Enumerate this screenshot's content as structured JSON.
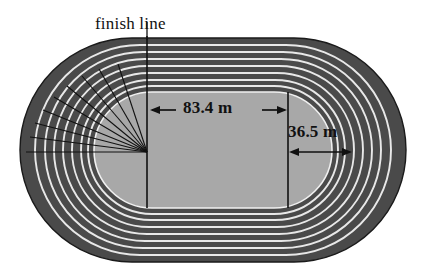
{
  "figure": {
    "type": "diagram",
    "background_color": "#ffffff"
  },
  "labels": {
    "finish_line": "finish line",
    "straight_length": "83.4 m",
    "curve_radius": "36.5 m"
  },
  "colors": {
    "infield": "#a8a8a8",
    "lane_surface": "#4a4a4a",
    "lane_divider": "#e8e8e8",
    "line_stroke": "#111111",
    "page_background": "#ffffff"
  },
  "geometry": {
    "lane_count": 8,
    "outer_left": 20,
    "outer_right": 406,
    "outer_top": 38,
    "outer_bottom": 262,
    "infield_left": 94,
    "infield_right": 332,
    "infield_top": 92,
    "infield_bottom": 208,
    "finish_line_x": 147,
    "straight_end_x": 288,
    "fan_origin_x": 147,
    "fan_origin_y": 152
  },
  "measurements": {
    "straight_length_value": 83.4,
    "straight_length_unit": "m",
    "curve_radius_value": 36.5,
    "curve_radius_unit": "m"
  },
  "annotations": {
    "radial_fan_line_count": 8,
    "dimension_arrow_style": "double-headed"
  }
}
